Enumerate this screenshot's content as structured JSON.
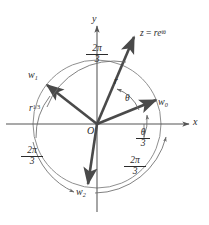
{
  "figure": {
    "axes": {
      "x_label": "x",
      "y_label": "y",
      "origin_label": "O"
    },
    "colors": {
      "vector": "#4a4a4a",
      "axis": "#555555",
      "circle": "#777777",
      "arc": "#6a6a6a",
      "text": "#2b2b2b",
      "background": "#ffffff"
    },
    "circle": {
      "radius_label": "r^{1/3}",
      "radius_label_base": "r",
      "radius_label_exp": "1/3"
    },
    "vectors": [
      {
        "name": "z",
        "label_z": "z",
        "label_eq": "=",
        "label_rhs": "re",
        "label_exp": "iθ",
        "magnitude_label": "r",
        "angle_label": "θ",
        "angle_deg": 67
      },
      {
        "name": "w0",
        "label_base": "w",
        "label_sub": "0",
        "angle_deg": 22
      },
      {
        "name": "w1",
        "label_base": "w",
        "label_sub": "1",
        "angle_deg": 142
      },
      {
        "name": "w2",
        "label_base": "w",
        "label_sub": "2",
        "angle_deg": 262
      }
    ],
    "arc_labels": [
      {
        "id": "top",
        "numerator": "2π",
        "denominator": "3"
      },
      {
        "id": "bottom-left",
        "numerator": "2π",
        "denominator": "3"
      },
      {
        "id": "bottom-right",
        "numerator": "2π",
        "denominator": "3"
      },
      {
        "id": "theta-over-3",
        "numerator": "θ",
        "denominator": "3"
      }
    ],
    "angle_theta": "θ"
  }
}
